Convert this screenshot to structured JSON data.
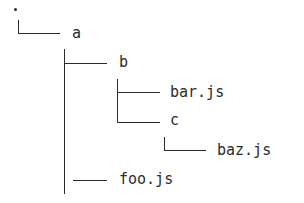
{
  "tree": {
    "root": {
      "label": "."
    },
    "nodes": [
      {
        "id": "a",
        "label": "a",
        "type": "folder",
        "depth": 1
      },
      {
        "id": "b",
        "label": "b",
        "type": "folder",
        "depth": 2
      },
      {
        "id": "bar",
        "label": "bar.js",
        "type": "file",
        "depth": 3
      },
      {
        "id": "c",
        "label": "c",
        "type": "folder",
        "depth": 3
      },
      {
        "id": "baz",
        "label": "baz.js",
        "type": "file",
        "depth": 4
      },
      {
        "id": "foo",
        "label": "foo.js",
        "type": "file",
        "depth": 2
      }
    ],
    "colors": {
      "line": "#2b2b2b",
      "text": "#2b2b2b",
      "background": "#ffffff"
    }
  }
}
